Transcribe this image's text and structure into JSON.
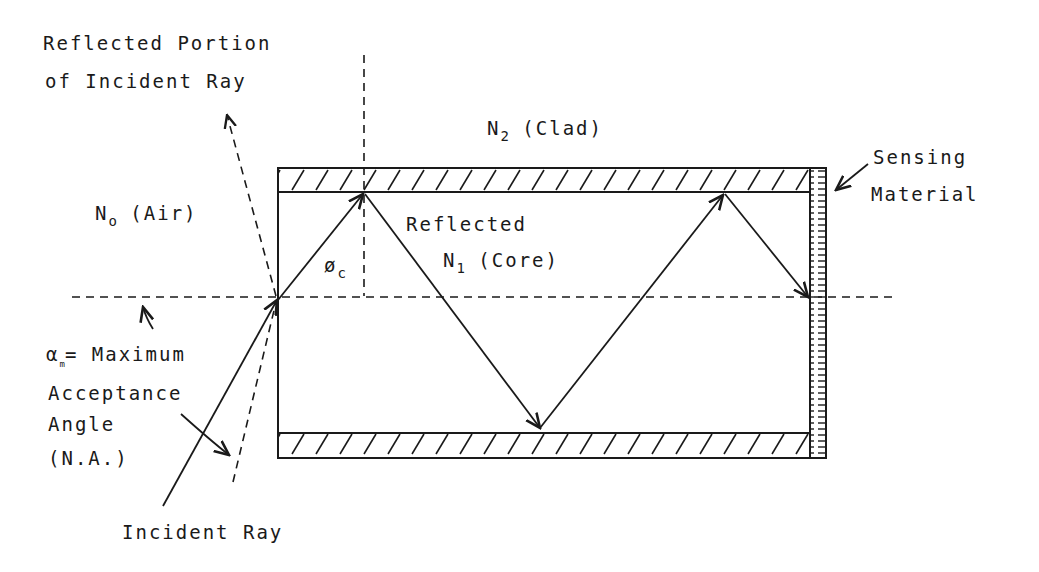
{
  "diagram": {
    "type": "optical-fiber-sensor-schematic",
    "labels": {
      "reflected_portion_line1": "Reflected Portion",
      "reflected_portion_line2": "of Incident Ray",
      "clad": {
        "symbol": "N",
        "subscript": "2",
        "text": "(Clad)"
      },
      "air": {
        "symbol": "N",
        "subscript": "o",
        "text": "(Air)"
      },
      "core": {
        "symbol": "N",
        "subscript": "1",
        "text": "(Core)"
      },
      "reflected": "Reflected",
      "critical_angle": {
        "symbol": "ø",
        "subscript": "c"
      },
      "sensing_line1": "Sensing",
      "sensing_line2": "Material",
      "acceptance": {
        "symbol": "α",
        "subscript": "m",
        "line1_rest": "= Maximum",
        "line2": "Acceptance",
        "line3": "Angle",
        "line4": "(N.A.)"
      },
      "incident_ray": "Incident Ray"
    },
    "colors": {
      "ink": "#1a1a1a",
      "background": "#ffffff"
    }
  }
}
